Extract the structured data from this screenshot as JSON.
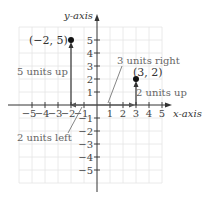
{
  "axes": {
    "x_label": "x-axis",
    "y_label": "y-axis",
    "x_ticks": [
      "−5",
      "−4",
      "−3",
      "−2",
      "−1",
      "1",
      "2",
      "3",
      "4",
      "5"
    ],
    "y_ticks_pos": [
      "1",
      "2",
      "3",
      "4",
      "5"
    ],
    "y_ticks_neg": [
      "−1",
      "−2",
      "−3",
      "−4",
      "−5"
    ]
  },
  "points": [
    {
      "label": "(−2, 5)",
      "x": -2,
      "y": 5
    },
    {
      "label": "(3, 2)",
      "x": 3,
      "y": 2
    }
  ],
  "annotations": {
    "five_up": "5 units up",
    "two_left": "2 units left",
    "three_right": "3 units right",
    "two_up": "2 units up"
  },
  "colors": {
    "grid": "#e2e2e2",
    "axis": "#333333",
    "text": "#444444",
    "annotation": "#666666"
  }
}
